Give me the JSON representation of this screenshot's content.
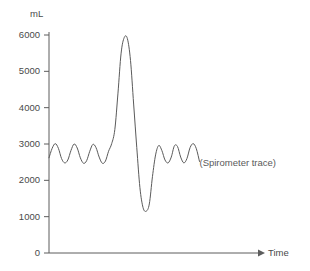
{
  "chart_data": {
    "type": "line",
    "title": "",
    "xlabel": "Time",
    "ylabel": "mL",
    "ylim": [
      0,
      6400
    ],
    "xlim": [
      0,
      100
    ],
    "grid": false,
    "legend": "none",
    "yticks": [
      0,
      1000,
      2000,
      3000,
      4000,
      5000,
      6000
    ],
    "ytick_labels": [
      "0",
      "1000",
      "2000",
      "3000",
      "4000",
      "5000",
      "6000"
    ],
    "annotations": [
      {
        "text": "(Spirometer trace)",
        "x": 72,
        "y": 2480
      }
    ],
    "series": [
      {
        "name": "Spirometer trace",
        "color": "#5a5a5a",
        "x": [
          0.0,
          1.5,
          3.0,
          4.5,
          6.0,
          7.5,
          9.0,
          10.5,
          12.0,
          13.5,
          15.0,
          16.5,
          18.0,
          19.5,
          21.0,
          22.5,
          24.0,
          25.5,
          27.0,
          28.5,
          30.0,
          31.5,
          33.0,
          34.5,
          36.0,
          37.5,
          39.0,
          40.5,
          42.0,
          43.5,
          45.0,
          46.5,
          48.0,
          49.5,
          51.0,
          52.5,
          54.0,
          55.5,
          57.0,
          58.5,
          60.0,
          61.5,
          63.0,
          64.5,
          66.0,
          67.5,
          69.0,
          70.5,
          72.0
        ],
        "y": [
          2620,
          2880,
          3010,
          2880,
          2600,
          2480,
          2560,
          2820,
          3000,
          2890,
          2620,
          2470,
          2540,
          2800,
          2990,
          2900,
          2640,
          2470,
          2530,
          2800,
          3010,
          3400,
          4400,
          5500,
          5930,
          5900,
          5300,
          4100,
          2900,
          1800,
          1250,
          1150,
          1350,
          2100,
          2700,
          2960,
          2820,
          2560,
          2480,
          2640,
          2950,
          2930,
          2640,
          2480,
          2600,
          2900,
          3010,
          2870,
          2520
        ],
        "description": "Tidal breathing oscillations (~2500-3000 mL), followed by a maximal inspiration to ~5950 mL and maximal expiration to ~1150 mL, then return to tidal breathing"
      }
    ]
  },
  "axes": {
    "y_axis_label": "mL",
    "x_axis_label": "Time"
  }
}
